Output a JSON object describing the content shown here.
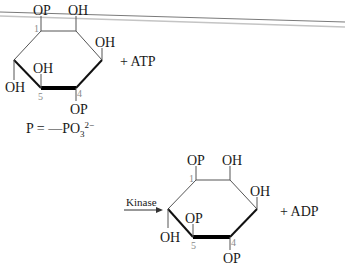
{
  "header_lines": {
    "color_dark": "#7a7a7a",
    "color_light": "#bdbdbd"
  },
  "reactant": {
    "top_left_group": "OP",
    "top_right_group": "OH",
    "right_group": "OH",
    "inner_group": "OH",
    "left_group": "OH",
    "bottom_group": "OP",
    "carbon_1": "1",
    "carbon_5": "5",
    "carbon_4": "4",
    "coreactant": "+ ATP"
  },
  "legend": {
    "lhs": "P = ",
    "dash": "—PO",
    "subscript": "3",
    "superscript": "2−"
  },
  "arrow": {
    "label": "Kinase"
  },
  "product": {
    "top_left_group": "OP",
    "top_right_group": "OH",
    "right_group": "OH",
    "inner_group": "OP",
    "left_group": "OH",
    "bottom_group": "OP",
    "carbon_1": "1",
    "carbon_5": "5",
    "carbon_4": "4",
    "coproduct": "+ ADP"
  }
}
